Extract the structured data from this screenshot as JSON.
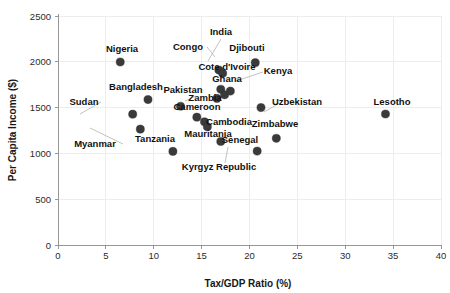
{
  "chart_data": {
    "type": "scatter",
    "title": "",
    "xlabel": "Tax/GDP Ratio (%)",
    "ylabel": "Per Capita Income ($)",
    "xlim": [
      0,
      40
    ],
    "ylim": [
      0,
      2500
    ],
    "xticks": [
      0,
      5,
      10,
      15,
      20,
      25,
      30,
      35,
      40
    ],
    "yticks": [
      0,
      500,
      1000,
      1500,
      2000,
      2500
    ],
    "grid": true,
    "legend": "none",
    "points": [
      {
        "label": "Nigeria",
        "x": 6.5,
        "y": 1998
      },
      {
        "label": "Bangladesh",
        "x": 9.4,
        "y": 1588
      },
      {
        "label": "Sudan",
        "x": 7.8,
        "y": 1428
      },
      {
        "label": "Myanmar",
        "x": 8.6,
        "y": 1265
      },
      {
        "label": "Pakistan",
        "x": 12.8,
        "y": 1515
      },
      {
        "label": "Tanzania",
        "x": 12.0,
        "y": 1022
      },
      {
        "label": "Cameroon",
        "x": 14.5,
        "y": 1395
      },
      {
        "label": "Congo",
        "x": 16.8,
        "y": 1910
      },
      {
        "label": "India",
        "x": 17.2,
        "y": 1875
      },
      {
        "label": "Cote d'Ivoire",
        "x": 17.0,
        "y": 1700
      },
      {
        "label": "Ghana",
        "x": 17.4,
        "y": 1640
      },
      {
        "label": "Zambia",
        "x": 16.6,
        "y": 1600
      },
      {
        "label": "Djibouti",
        "x": 20.6,
        "y": 1990
      },
      {
        "label": "Kenya",
        "x": 18.0,
        "y": 1680
      },
      {
        "label": "Cambodia",
        "x": 15.3,
        "y": 1345
      },
      {
        "label": "Mauritania",
        "x": 15.6,
        "y": 1290
      },
      {
        "label": "Kyrgyz Republic",
        "x": 17.0,
        "y": 1130
      },
      {
        "label": "Zimbabwe",
        "x": 21.2,
        "y": 1500
      },
      {
        "label": "Senegal",
        "x": 22.8,
        "y": 1165
      },
      {
        "label": "Uzbekistan",
        "x": 20.8,
        "y": 1025
      },
      {
        "label": "Lesotho",
        "x": 34.2,
        "y": 1430
      }
    ]
  },
  "labels": {
    "Nigeria": {
      "text": "Nigeria",
      "lx": 122,
      "ly": 52,
      "anchor": "mid",
      "leader": false
    },
    "Bangladesh": {
      "text": "Bangladesh",
      "lx": 136,
      "ly": 90,
      "anchor": "mid",
      "leader": false
    },
    "Sudan": {
      "text": "Sudan",
      "lx": 84,
      "ly": 105,
      "anchor": "mid",
      "leader": true
    },
    "Myanmar": {
      "text": "Myanmar",
      "lx": 95,
      "ly": 147,
      "anchor": "mid",
      "leader": true
    },
    "Pakistan": {
      "text": "Pakistan",
      "lx": 183,
      "ly": 93,
      "anchor": "mid",
      "leader": true
    },
    "Tanzania": {
      "text": "Tanzania",
      "lx": 155,
      "ly": 142,
      "anchor": "mid",
      "leader": false
    },
    "Cameroon": {
      "text": "Cameroon",
      "lx": 197,
      "ly": 110,
      "anchor": "mid",
      "leader": false
    },
    "Congo": {
      "text": "Congo",
      "lx": 188,
      "ly": 50,
      "anchor": "mid",
      "leader": true
    },
    "India": {
      "text": "India",
      "lx": 221,
      "ly": 35,
      "anchor": "mid",
      "leader": true
    },
    "Cote d'Ivoire": {
      "text": "Cote d'Ivoire",
      "lx": 227,
      "ly": 70,
      "anchor": "mid",
      "leader": false
    },
    "Ghana": {
      "text": "Ghana",
      "lx": 227,
      "ly": 82,
      "anchor": "mid",
      "leader": false
    },
    "Zambia": {
      "text": "Zambia",
      "lx": 205,
      "ly": 101,
      "anchor": "mid",
      "leader": false
    },
    "Djibouti": {
      "text": "Djibouti",
      "lx": 247,
      "ly": 51,
      "anchor": "mid",
      "leader": false
    },
    "Kenya": {
      "text": "Kenya",
      "lx": 278,
      "ly": 74,
      "anchor": "mid",
      "leader": true
    },
    "Cambodia": {
      "text": "Cambodia",
      "lx": 229,
      "ly": 125,
      "anchor": "mid",
      "leader": false
    },
    "Mauritania": {
      "text": "Mauritania",
      "lx": 208,
      "ly": 137,
      "anchor": "mid",
      "leader": false
    },
    "Kyrgyz Republic": {
      "text": "Kyrgyz Republic",
      "lx": 219,
      "ly": 170,
      "anchor": "mid",
      "leader": true
    },
    "Zimbabwe": {
      "text": "Zimbabwe",
      "lx": 275,
      "ly": 127,
      "anchor": "mid",
      "leader": false
    },
    "Senegal": {
      "text": "Senegal",
      "lx": 240,
      "ly": 143,
      "anchor": "mid",
      "leader": false
    },
    "Uzbekistan": {
      "text": "Uzbekistan",
      "lx": 297,
      "ly": 105,
      "anchor": "mid",
      "leader": true
    },
    "Lesotho": {
      "text": "Lesotho",
      "lx": 392,
      "ly": 105,
      "anchor": "mid",
      "leader": false
    }
  },
  "leaders": [
    {
      "name": "sudan-leader",
      "from": [
        101,
        102
      ],
      "to": [
        80,
        114
      ]
    },
    {
      "name": "myanmar-leader",
      "from": [
        123,
        144
      ],
      "to": [
        90,
        128
      ]
    },
    {
      "name": "pakistan-leader",
      "from": [
        196,
        96
      ],
      "to": [
        185,
        101
      ]
    },
    {
      "name": "congo-leader",
      "from": [
        207,
        47
      ],
      "to": [
        215,
        57
      ]
    },
    {
      "name": "india-leader",
      "from": [
        221,
        39
      ],
      "to": [
        208,
        61
      ]
    },
    {
      "name": "kenya-leader",
      "from": [
        263,
        72
      ],
      "to": [
        236,
        81
      ]
    },
    {
      "name": "kyrgyz-leader",
      "from": [
        225,
        163
      ],
      "to": [
        228,
        147
      ]
    },
    {
      "name": "uzbek-leader",
      "from": [
        280,
        103
      ],
      "to": [
        264,
        112
      ]
    }
  ],
  "axes": {
    "x_title": "Tax/GDP Ratio (%)",
    "y_title": "Per Capita Income ($)",
    "x_tick_labels": [
      "0",
      "5",
      "10",
      "15",
      "20",
      "25",
      "30",
      "35",
      "40"
    ],
    "y_tick_labels": [
      "0",
      "500",
      "1000",
      "1500",
      "2000",
      "2500"
    ]
  },
  "colors": {
    "point": "#3a3a3a",
    "grid": "#e9e9e9",
    "axis": "#8c8c8c",
    "text": "#111111",
    "background": "#ffffff"
  }
}
